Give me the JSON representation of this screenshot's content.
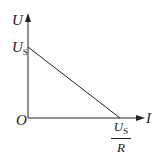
{
  "diagram": {
    "type": "U-I linear graph",
    "y_axis_label": "U",
    "x_axis_label": "I",
    "origin_label": "O",
    "y_intercept": {
      "main": "U",
      "sub": "S"
    },
    "x_intercept": {
      "numerator_main": "U",
      "numerator_sub": "S",
      "denominator": "R"
    },
    "line": {
      "from": "y-intercept U_S",
      "to": "x-intercept U_S/R"
    }
  }
}
